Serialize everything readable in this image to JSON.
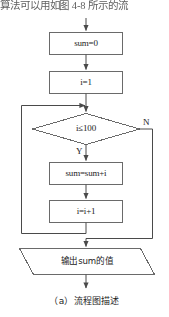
{
  "page": {
    "intro_text": "算法可以用如图 4-8 所示的流",
    "caption": "（a）流程图描述"
  },
  "flowchart": {
    "title": "求1到100累加和的流程图",
    "nodes": [
      {
        "id": "init-sum",
        "shape": "process",
        "text": "sum=0"
      },
      {
        "id": "init-i",
        "shape": "process",
        "text": "i=1"
      },
      {
        "id": "condition",
        "shape": "decision",
        "text": "i≤100"
      },
      {
        "id": "accumulate",
        "shape": "process",
        "text": "sum=sum+i"
      },
      {
        "id": "increment",
        "shape": "process",
        "text": "i=i+1"
      },
      {
        "id": "output",
        "shape": "parallelogram",
        "text": "输出sum的值"
      }
    ],
    "branch_labels": {
      "yes": "Y",
      "no": "N"
    },
    "stroke_color": "#555555",
    "text_color": "#1c1c1c"
  }
}
